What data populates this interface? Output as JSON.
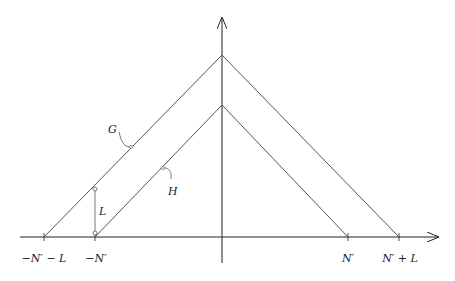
{
  "diagram": {
    "type": "piecewise-linear tent functions",
    "colors": {
      "lines": "#555555",
      "axes": "#222222",
      "background": "#ffffff"
    },
    "curves": [
      {
        "name": "G",
        "label": "G",
        "apex": [
          222,
          55
        ],
        "left_base_x": 44,
        "right_base_x": 399
      },
      {
        "name": "H",
        "label": "H",
        "apex": [
          222,
          105
        ],
        "left_base_x": 95,
        "right_base_x": 348
      }
    ],
    "axis_ticks": [
      {
        "label": "−N′ − L",
        "x": 44
      },
      {
        "label": "−N′",
        "x": 95
      },
      {
        "label": "N′",
        "x": 348
      },
      {
        "label": "N′ + L",
        "x": 399
      }
    ],
    "gap_label": "L",
    "labels": {
      "G": "G",
      "H": "H",
      "L": "L"
    }
  }
}
